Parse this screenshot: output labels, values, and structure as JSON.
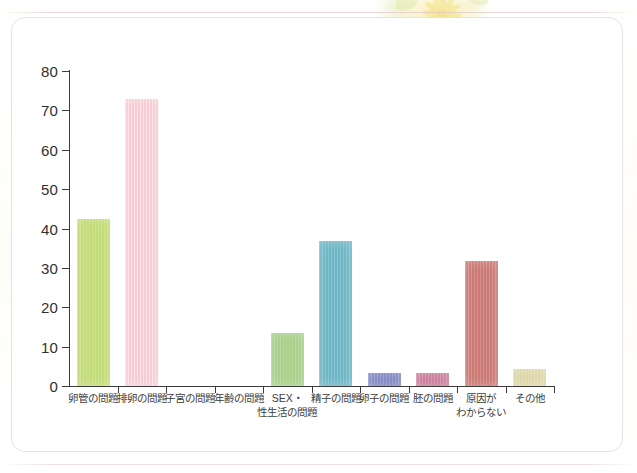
{
  "page": {
    "background_color": "#ffffff",
    "card_color": "#ffffff",
    "card_border_color": "#e6e3de",
    "decoration": "faint-yellow-flower-graphic-top-center"
  },
  "chart_data": {
    "type": "bar",
    "title": "",
    "subtitle": "",
    "xlabel": "",
    "ylabel": "",
    "ylim": [
      0,
      80
    ],
    "ytick_step": 10,
    "ytick_labels": [
      "0",
      "10",
      "20",
      "30",
      "40",
      "50",
      "60",
      "70",
      "80"
    ],
    "ytick_values": [
      0,
      10,
      20,
      30,
      40,
      50,
      60,
      70,
      80
    ],
    "grid": false,
    "legend": "none",
    "categories": [
      "卵管の問題",
      "排卵の問題",
      "子宮の問題",
      "年齢の問題",
      "SEX・\n性生活の問題",
      "精子の問題",
      "卵子の問題",
      "胚の問題",
      "原因が\nわからない",
      "その他"
    ],
    "values": [
      42.5,
      73.0,
      0,
      0,
      13.5,
      36.8,
      3.4,
      3.3,
      31.7,
      4.2
    ],
    "bar_colors": [
      "#c2dc78",
      "#f8ccd4",
      "#ffffff",
      "#ffffff",
      "#a8d08a",
      "#6fb7c6",
      "#7f87c2",
      "#c97b99",
      "#cb7a75",
      "#ddd7a8"
    ],
    "axis_color": "#3b3b3b",
    "text_color": "#3d3d3d"
  }
}
